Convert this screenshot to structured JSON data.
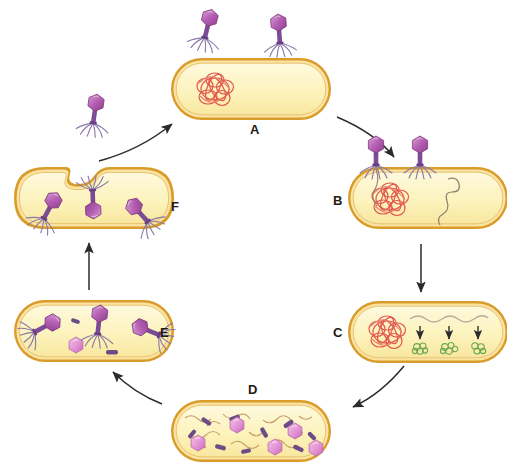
{
  "diagram": {
    "background": "#ffffff",
    "palette": {
      "cell_wall_outer": "#d99b29",
      "cell_wall_inner": "#f2c25a",
      "cytoplasm": "#fdf6c8",
      "cytoplasm_edge": "#f7e9a0",
      "bacterial_dna": "#e2574c",
      "bacterial_dna_light": "#e8a08c",
      "phage_dna": "#8e7f76",
      "phage_head": "#a24fa0",
      "phage_head_light": "#d58fd2",
      "phage_tail": "#7c4b96",
      "phage_fiber": "#8878a8",
      "protein_green": "#6aa84f",
      "arrow": "#2b2b2b",
      "label": "#231a10",
      "component_head": "#e58fd0",
      "component_tail": "#6d4b86",
      "component_fiber": "#c9a06a"
    },
    "stages": [
      {
        "id": "A",
        "label": "A",
        "label_position": "below",
        "caption": "Phage attaches to host cell",
        "phage_count": 2,
        "has_bacterial_dna": true,
        "cell_intact": true
      },
      {
        "id": "B",
        "label": "B",
        "label_position": "left",
        "caption": "Phage injects DNA into host cell",
        "phage_count": 2,
        "has_bacterial_dna": true,
        "has_injected_dna": true,
        "cell_intact": true
      },
      {
        "id": "C",
        "label": "C",
        "label_position": "left",
        "caption": "Phage DNA is transcribed and translated into phage proteins",
        "mrna_strands": 1,
        "arrow_count": 3,
        "protein_clusters": 3,
        "has_bacterial_dna": true,
        "cell_intact": true
      },
      {
        "id": "D",
        "label": "D",
        "label_position": "above",
        "caption": "Phage components accumulate in host cell",
        "component_heads": 5,
        "component_tails": 9,
        "cell_intact": true
      },
      {
        "id": "E",
        "label": "E",
        "label_position": "right",
        "caption": "New phage particles are assembled",
        "assembled_phages": 3,
        "leftover_head": 1,
        "cell_intact": true
      },
      {
        "id": "F",
        "label": "F",
        "label_position": "right",
        "caption": "Host cell lyses and releases new phages",
        "phages_inside": 3,
        "phages_released": 1,
        "cell_intact": false
      }
    ],
    "arrows": [
      {
        "from": "F",
        "to": "A",
        "style": "curved",
        "direction": "up-right"
      },
      {
        "from": "A",
        "to": "B",
        "style": "curved",
        "direction": "down-right"
      },
      {
        "from": "B",
        "to": "C",
        "style": "straight",
        "direction": "down"
      },
      {
        "from": "C",
        "to": "D",
        "style": "curved",
        "direction": "down-left"
      },
      {
        "from": "D",
        "to": "E",
        "style": "curved",
        "direction": "up-left"
      },
      {
        "from": "E",
        "to": "F",
        "style": "straight",
        "direction": "up"
      }
    ]
  }
}
